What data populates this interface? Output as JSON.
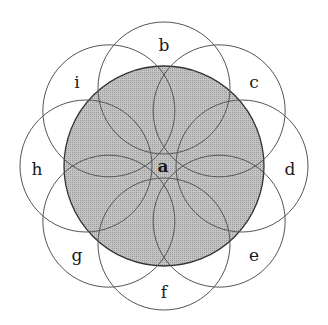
{
  "diagram": {
    "type": "overlapping-circles",
    "center_circle": {
      "label": "a",
      "cx": 164,
      "cy": 166,
      "r": 100,
      "fill": "#b5b5b5",
      "stroke": "#333333"
    },
    "outer_circle_radius": 66,
    "outer_circle_offset": 78,
    "stroke_color": "#555555",
    "outer_circles": [
      {
        "label": "b",
        "angle": -90,
        "lx": 164,
        "ly": 51
      },
      {
        "label": "c",
        "angle": -45,
        "lx": 254,
        "ly": 88
      },
      {
        "label": "d",
        "angle": 0,
        "lx": 290,
        "ly": 175
      },
      {
        "label": "e",
        "angle": 45,
        "lx": 254,
        "ly": 261
      },
      {
        "label": "f",
        "angle": 90,
        "lx": 164,
        "ly": 298
      },
      {
        "label": "g",
        "angle": 135,
        "lx": 77,
        "ly": 261
      },
      {
        "label": "h",
        "angle": 180,
        "lx": 37,
        "ly": 175
      },
      {
        "label": "i",
        "angle": -135,
        "lx": 77,
        "ly": 88
      }
    ]
  }
}
